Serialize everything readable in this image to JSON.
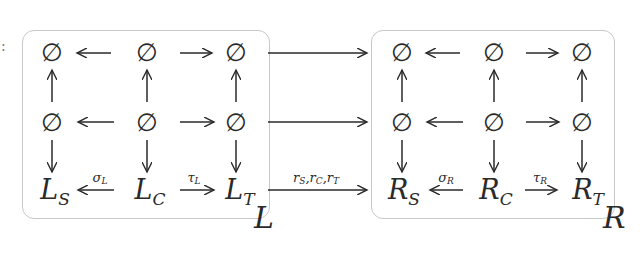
{
  "diagram": {
    "type": "commutative-diagram",
    "left_box": {
      "name": "L",
      "grid": [
        [
          "∅",
          "∅",
          "∅"
        ],
        [
          "∅",
          "∅",
          "∅"
        ],
        [
          "L_S",
          "L_C",
          "L_T"
        ]
      ],
      "bottom": {
        "S": {
          "base": "L",
          "sub": "S"
        },
        "C": {
          "base": "L",
          "sub": "C"
        },
        "T": {
          "base": "L",
          "sub": "T"
        }
      },
      "labels": {
        "sigma": {
          "base": "σ",
          "sub": "L"
        },
        "tau": {
          "base": "τ",
          "sub": "L"
        }
      }
    },
    "right_box": {
      "name": "R",
      "grid": [
        [
          "∅",
          "∅",
          "∅"
        ],
        [
          "∅",
          "∅",
          "∅"
        ],
        [
          "R_S",
          "R_C",
          "R_T"
        ]
      ],
      "bottom": {
        "S": {
          "base": "R",
          "sub": "S"
        },
        "C": {
          "base": "R",
          "sub": "C"
        },
        "T": {
          "base": "R",
          "sub": "T"
        }
      },
      "labels": {
        "sigma": {
          "base": "σ",
          "sub": "R"
        },
        "tau": {
          "base": "τ",
          "sub": "R"
        }
      }
    },
    "empty_symbol": "∅",
    "morphism_label": {
      "parts": [
        {
          "base": "r",
          "sub": "S"
        },
        {
          "base": "r",
          "sub": "C"
        },
        {
          "base": "r",
          "sub": "T"
        }
      ],
      "separator": ","
    },
    "stray_mark": ":"
  }
}
